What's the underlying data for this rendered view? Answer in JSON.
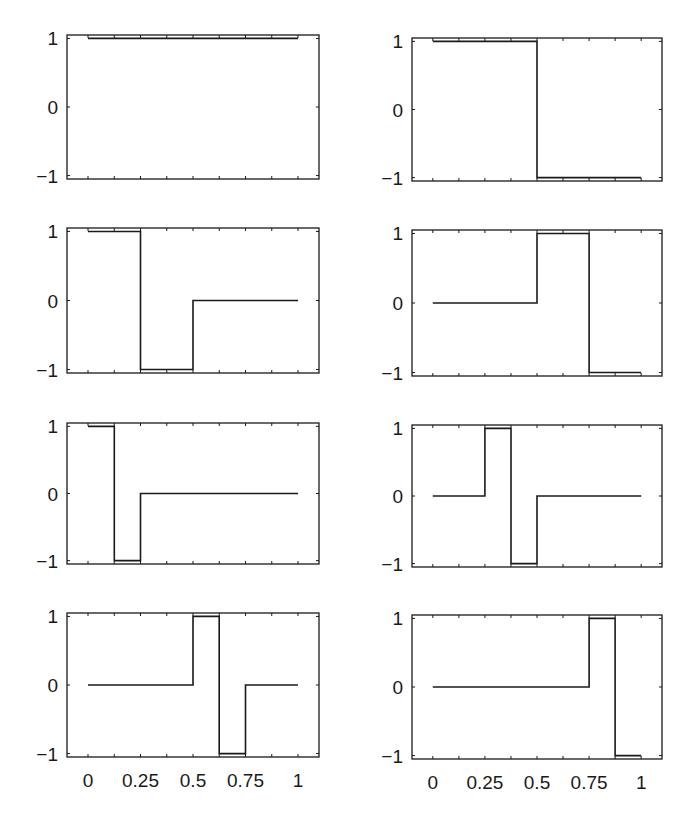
{
  "chart_data": [
    {
      "type": "line",
      "step": true,
      "panel": "row1-left",
      "x": [
        0,
        1
      ],
      "y": [
        1,
        1
      ],
      "xlim": [
        -0.1,
        1.1
      ],
      "ylim": [
        -1.05,
        1.05
      ],
      "yticks": [
        -1,
        0,
        1
      ],
      "ytick_labels": [
        "−1",
        "0",
        "1"
      ],
      "xticks": [
        0,
        0.25,
        0.5,
        0.75,
        1
      ],
      "xtick_labels": [],
      "grid": false
    },
    {
      "type": "line",
      "step": true,
      "panel": "row1-right",
      "x": [
        0,
        0.5,
        0.5,
        1
      ],
      "y": [
        1,
        1,
        -1,
        -1
      ],
      "xlim": [
        -0.1,
        1.1
      ],
      "ylim": [
        -1.05,
        1.05
      ],
      "yticks": [
        -1,
        0,
        1
      ],
      "ytick_labels": [
        "−1",
        "0",
        "1"
      ],
      "xticks": [
        0,
        0.25,
        0.5,
        0.75,
        1
      ],
      "xtick_labels": [],
      "grid": false
    },
    {
      "type": "line",
      "step": true,
      "panel": "row2-left",
      "x": [
        0,
        0.25,
        0.25,
        0.5,
        0.5,
        1
      ],
      "y": [
        1,
        1,
        -1,
        -1,
        0,
        0
      ],
      "xlim": [
        -0.1,
        1.1
      ],
      "ylim": [
        -1.05,
        1.05
      ],
      "yticks": [
        -1,
        0,
        1
      ],
      "ytick_labels": [
        "−1",
        "0",
        "1"
      ],
      "xticks": [
        0,
        0.25,
        0.5,
        0.75,
        1
      ],
      "xtick_labels": [],
      "grid": false
    },
    {
      "type": "line",
      "step": true,
      "panel": "row2-right",
      "x": [
        0,
        0.5,
        0.5,
        0.75,
        0.75,
        1
      ],
      "y": [
        0,
        0,
        1,
        1,
        -1,
        -1
      ],
      "xlim": [
        -0.1,
        1.1
      ],
      "ylim": [
        -1.05,
        1.05
      ],
      "yticks": [
        -1,
        0,
        1
      ],
      "ytick_labels": [
        "−1",
        "0",
        "1"
      ],
      "xticks": [
        0,
        0.25,
        0.5,
        0.75,
        1
      ],
      "xtick_labels": [],
      "grid": false
    },
    {
      "type": "line",
      "step": true,
      "panel": "row3-left",
      "x": [
        0,
        0.125,
        0.125,
        0.25,
        0.25,
        1
      ],
      "y": [
        1,
        1,
        -1,
        -1,
        0,
        0
      ],
      "xlim": [
        -0.1,
        1.1
      ],
      "ylim": [
        -1.05,
        1.05
      ],
      "yticks": [
        -1,
        0,
        1
      ],
      "ytick_labels": [
        "−1",
        "0",
        "1"
      ],
      "xticks": [
        0,
        0.25,
        0.5,
        0.75,
        1
      ],
      "xtick_labels": [],
      "grid": false
    },
    {
      "type": "line",
      "step": true,
      "panel": "row3-right",
      "x": [
        0,
        0.25,
        0.25,
        0.375,
        0.375,
        0.5,
        0.5,
        1
      ],
      "y": [
        0,
        0,
        1,
        1,
        -1,
        -1,
        0,
        0
      ],
      "xlim": [
        -0.1,
        1.1
      ],
      "ylim": [
        -1.05,
        1.05
      ],
      "yticks": [
        -1,
        0,
        1
      ],
      "ytick_labels": [
        "−1",
        "0",
        "1"
      ],
      "xticks": [
        0,
        0.25,
        0.5,
        0.75,
        1
      ],
      "xtick_labels": [],
      "grid": false
    },
    {
      "type": "line",
      "step": true,
      "panel": "row4-left",
      "x": [
        0,
        0.5,
        0.5,
        0.625,
        0.625,
        0.75,
        0.75,
        1
      ],
      "y": [
        0,
        0,
        1,
        1,
        -1,
        -1,
        0,
        0
      ],
      "xlim": [
        -0.1,
        1.1
      ],
      "ylim": [
        -1.05,
        1.05
      ],
      "yticks": [
        -1,
        0,
        1
      ],
      "ytick_labels": [
        "−1",
        "0",
        "1"
      ],
      "xticks": [
        0,
        0.25,
        0.5,
        0.75,
        1
      ],
      "xtick_labels": [
        "0",
        "0.25",
        "0.5",
        "0.75",
        "1"
      ],
      "grid": false
    },
    {
      "type": "line",
      "step": true,
      "panel": "row4-right",
      "x": [
        0,
        0.75,
        0.75,
        0.875,
        0.875,
        1
      ],
      "y": [
        0,
        0,
        1,
        1,
        -1,
        -1
      ],
      "xlim": [
        -0.1,
        1.1
      ],
      "ylim": [
        -1.05,
        1.05
      ],
      "yticks": [
        -1,
        0,
        1
      ],
      "ytick_labels": [
        "−1",
        "0",
        "1"
      ],
      "xticks": [
        0,
        0.25,
        0.5,
        0.75,
        1
      ],
      "xtick_labels": [
        "0",
        "0.25",
        "0.5",
        "0.75",
        "1"
      ],
      "grid": false
    }
  ],
  "layout": {
    "panels": [
      {
        "left": 67,
        "top": 35,
        "width": 252,
        "height": 144
      },
      {
        "left": 412,
        "top": 38,
        "width": 250,
        "height": 143
      },
      {
        "left": 67,
        "top": 228,
        "width": 252,
        "height": 145
      },
      {
        "left": 412,
        "top": 230,
        "width": 250,
        "height": 146
      },
      {
        "left": 67,
        "top": 423,
        "width": 252,
        "height": 141
      },
      {
        "left": 412,
        "top": 425,
        "width": 250,
        "height": 142
      },
      {
        "left": 67,
        "top": 613,
        "width": 252,
        "height": 144
      },
      {
        "left": 412,
        "top": 615,
        "width": 250,
        "height": 144
      }
    ],
    "line_color": "#1a1a1a",
    "axis_color": "#1a1a1a",
    "minor_ticks_per_interval": 2
  }
}
